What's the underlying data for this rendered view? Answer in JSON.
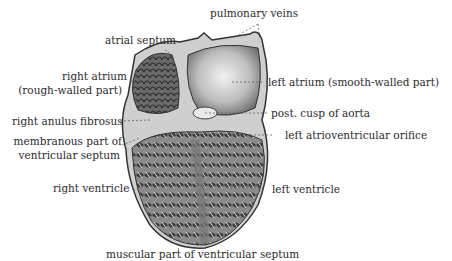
{
  "diagram": {
    "labels": [
      {
        "id": "pulmonary-veins",
        "text": "pulmonary veins"
      },
      {
        "id": "atrial-septum",
        "text": "atrial septum"
      },
      {
        "id": "right-atrium",
        "text": "right atrium",
        "text2": "(rough-walled part)"
      },
      {
        "id": "left-atrium",
        "text": "left atrium (smooth-walled part)"
      },
      {
        "id": "right-anulus-fibrosus",
        "text": "right anulus fibrosus"
      },
      {
        "id": "post-cusp-aorta",
        "text": "post. cusp of aorta"
      },
      {
        "id": "membranous-septum",
        "text": "membranous part of",
        "text2": "ventricular septum"
      },
      {
        "id": "left-av-orifice",
        "text": "left atrioventricular orifice"
      },
      {
        "id": "right-ventricle",
        "text": "right ventricle"
      },
      {
        "id": "left-ventricle",
        "text": "left ventricle"
      },
      {
        "id": "muscular-septum",
        "text": "muscular part of ventricular septum"
      }
    ],
    "colors": {
      "background": "#ffffff",
      "text": "#2b2b2b",
      "outline": "#333333",
      "tissue_dark": "#5a5a5a",
      "tissue_mid": "#9a9a9a",
      "tissue_light": "#e6e6e6"
    }
  }
}
